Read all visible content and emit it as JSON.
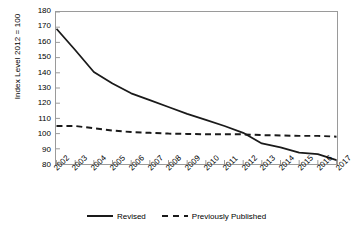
{
  "chart_data": {
    "type": "line",
    "title": "",
    "xlabel": "",
    "ylabel": "Index Level 2012 = 100",
    "ylim": [
      80,
      180
    ],
    "ytick_step": 10,
    "yticks": [
      180,
      170,
      160,
      150,
      140,
      130,
      120,
      110,
      100,
      90,
      80
    ],
    "grid": false,
    "legend_position": "bottom",
    "categories": [
      "2002",
      "2003",
      "2004",
      "2005",
      "2006",
      "2007",
      "2008",
      "2009",
      "2010",
      "2011",
      "2012",
      "2013",
      "2014",
      "2015",
      "2016",
      "2017"
    ],
    "series": [
      {
        "name": "Revised",
        "style": "solid",
        "color": "#1a1a1a",
        "values": [
          169,
          155,
          140.5,
          133,
          126.5,
          122,
          117.5,
          113,
          109,
          105,
          100.5,
          93.5,
          91,
          87.5,
          86.5,
          82.5
        ]
      },
      {
        "name": "Previously Published",
        "style": "dashed",
        "color": "#1a1a1a",
        "values": [
          105,
          105,
          103.5,
          102,
          101,
          100.5,
          100,
          99.8,
          99.5,
          99.5,
          99.5,
          99,
          98.8,
          98.5,
          98.5,
          98
        ]
      }
    ]
  },
  "axes": {
    "y_title": "Index Level 2012 = 100",
    "y_tick_labels": [
      "180",
      "170",
      "160",
      "150",
      "140",
      "130",
      "120",
      "110",
      "100",
      "90",
      "80"
    ],
    "x_tick_labels": [
      "2002",
      "2003",
      "2004",
      "2005",
      "2006",
      "2007",
      "2008",
      "2009",
      "2010",
      "2011",
      "2012",
      "2013",
      "2014",
      "2015",
      "2016",
      "2017"
    ]
  },
  "legend": {
    "items": [
      {
        "label": "Revised",
        "style": "solid"
      },
      {
        "label": "Previously Published",
        "style": "dashed"
      }
    ]
  },
  "colors": {
    "line": "#1a1a1a",
    "frame": "#9a9a9a",
    "background": "#ffffff",
    "text": "#000000"
  }
}
